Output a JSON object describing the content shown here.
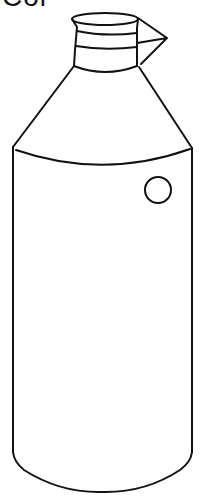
{
  "caption": {
    "text": "Col",
    "clipped": true
  },
  "illustration": {
    "subject": "bottle-with-spout-icon",
    "style": "black line drawing on white",
    "stroke_color": "#111111",
    "background_color": "#ffffff",
    "features": [
      "top-opening",
      "neck-bands",
      "pour-spout",
      "conical-shoulder",
      "cylindrical-body",
      "round-label-circle",
      "rounded-base"
    ]
  }
}
